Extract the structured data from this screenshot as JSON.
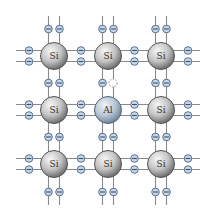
{
  "diagram": {
    "title": "",
    "colors": {
      "bond_line": "#8a8a8a",
      "si_light": "#f7f7f7",
      "si_mid": "#c4c4c4",
      "si_dark": "#6a6a6a",
      "si_rim": "#555555",
      "al_light": "#eef3f8",
      "al_mid": "#b9c6d4",
      "al_dark": "#6f8199",
      "al_rim": "#55657a",
      "electron_fill": "#c9d8e8",
      "electron_stroke": "#4a6282",
      "electron_minus": "#3a5070",
      "hole_stroke": "#8a8a8a"
    },
    "atoms": [
      {
        "label": "Si",
        "type": "si",
        "row": 0,
        "col": 0,
        "cx": 54,
        "cy": 56
      },
      {
        "label": "Si",
        "type": "si",
        "row": 0,
        "col": 1,
        "cx": 108,
        "cy": 56
      },
      {
        "label": "Si",
        "type": "si",
        "row": 0,
        "col": 2,
        "cx": 161,
        "cy": 56
      },
      {
        "label": "Si",
        "type": "si",
        "row": 1,
        "col": 0,
        "cx": 54,
        "cy": 110
      },
      {
        "label": "Al",
        "type": "al",
        "row": 1,
        "col": 1,
        "cx": 108,
        "cy": 110
      },
      {
        "label": "Si",
        "type": "si",
        "row": 1,
        "col": 2,
        "cx": 161,
        "cy": 110
      },
      {
        "label": "Si",
        "type": "si",
        "row": 2,
        "col": 0,
        "cx": 54,
        "cy": 164
      },
      {
        "label": "Si",
        "type": "si",
        "row": 2,
        "col": 2,
        "cx": 161,
        "cy": 164
      },
      {
        "label": "Si",
        "type": "si",
        "row": 2,
        "col": 1,
        "cx": 108,
        "cy": 164
      }
    ],
    "electron_symbol": "−",
    "hole": {
      "cx": 113,
      "cy": 83,
      "label": "hole"
    }
  }
}
